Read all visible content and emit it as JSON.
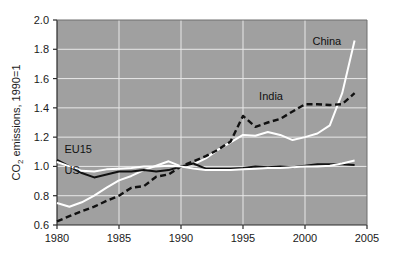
{
  "chart_data": {
    "type": "line",
    "title": "",
    "subtitle": "",
    "xlabel": "",
    "ylabel": "CO2 emissions, 1990=1",
    "ylabel_main": "CO",
    "ylabel_sub": "2",
    "ylabel_rest": " emissions, 1990=1",
    "xlim": [
      1980,
      2005
    ],
    "ylim": [
      0.6,
      2.0
    ],
    "xticks": [
      1980,
      1985,
      1990,
      1995,
      2000,
      2005
    ],
    "xtick_labels": [
      "1980",
      "1985",
      "1990",
      "1995",
      "2000",
      "2005"
    ],
    "yticks": [
      0.6,
      0.8,
      1.0,
      1.2,
      1.4,
      1.6,
      1.8,
      2.0
    ],
    "ytick_labels": [
      "0.6",
      "0.8",
      "1.0",
      "1.2",
      "1.4",
      "1.6",
      "1.8",
      "2.0"
    ],
    "grid": true,
    "grid_color": "#e8e8e8",
    "plot_background": "#a0a0a0",
    "legend_position": "inline-annotations",
    "x": [
      1980,
      1981,
      1982,
      1983,
      1984,
      1985,
      1986,
      1987,
      1988,
      1989,
      1990,
      1991,
      1992,
      1993,
      1994,
      1995,
      1996,
      1997,
      1998,
      1999,
      2000,
      2001,
      2002,
      2003,
      2004
    ],
    "series": [
      {
        "name": "China",
        "color": "#ffffff",
        "style": "solid",
        "label_x": 2000.6,
        "label_y": 1.83,
        "label_color": "#111111",
        "values": [
          0.75,
          0.725,
          0.755,
          0.8,
          0.855,
          0.905,
          0.935,
          0.975,
          1.005,
          1.035,
          1.0,
          1.015,
          1.055,
          1.115,
          1.165,
          1.215,
          1.21,
          1.235,
          1.215,
          1.18,
          1.2,
          1.225,
          1.28,
          1.5,
          1.86
        ]
      },
      {
        "name": "India",
        "color": "#111111",
        "style": "dashed",
        "label_x": 1996.3,
        "label_y": 1.455,
        "label_color": "#111111",
        "values": [
          0.625,
          0.66,
          0.695,
          0.725,
          0.765,
          0.8,
          0.855,
          0.865,
          0.93,
          0.945,
          1.0,
          1.035,
          1.07,
          1.115,
          1.17,
          1.345,
          1.27,
          1.3,
          1.325,
          1.375,
          1.425,
          1.425,
          1.42,
          1.425,
          1.5
        ]
      },
      {
        "name": "EU15",
        "color": "#111111",
        "style": "solid",
        "label_x": 1980.6,
        "label_y": 1.095,
        "label_color": "#111111",
        "values": [
          1.045,
          1.0,
          0.955,
          0.925,
          0.945,
          0.965,
          0.965,
          0.975,
          0.965,
          0.975,
          1.0,
          1.02,
          0.985,
          0.985,
          0.985,
          0.99,
          1.0,
          0.995,
          1.0,
          0.995,
          1.005,
          1.015,
          1.015,
          1.015,
          1.01
        ]
      },
      {
        "name": "US",
        "color": "#ffffff",
        "style": "solid",
        "label_x": 1980.6,
        "label_y": 0.945,
        "label_color": "#111111",
        "values": [
          1.03,
          1.0,
          0.97,
          0.965,
          0.98,
          0.985,
          0.99,
          1.0,
          1.0,
          1.005,
          1.0,
          0.985,
          0.975,
          0.975,
          0.975,
          0.98,
          0.985,
          0.99,
          0.99,
          0.995,
          1.0,
          1.0,
          1.005,
          1.02,
          1.04
        ]
      }
    ]
  }
}
